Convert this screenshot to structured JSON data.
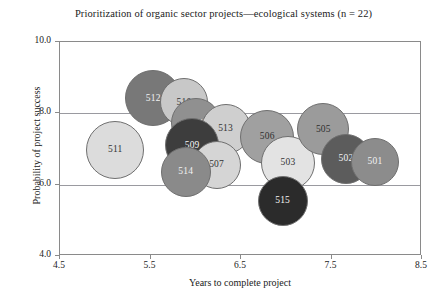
{
  "chart_data": {
    "type": "scatter",
    "title": "Prioritization of organic sector projects—ecological systems (n = 22)",
    "xlabel": "Years to complete project",
    "ylabel": "Probability of project success",
    "xlim": [
      4.5,
      8.5
    ],
    "ylim": [
      4.0,
      10.0
    ],
    "xticks": [
      "4.5",
      "5.5",
      "6.5",
      "7.5",
      "8.5"
    ],
    "yticks": [
      "4.0",
      "6.0",
      "8.0",
      "10.0"
    ],
    "grid": "horizontal",
    "legend": "none",
    "note": "Bubble chart; bubble area encodes project size/budget. Labels are project ID numbers.",
    "points": [
      {
        "label": "511",
        "x": 5.11,
        "y": 6.97,
        "r": 29,
        "color": "#dcdcdc",
        "text_color": "#333333"
      },
      {
        "label": "512",
        "x": 5.53,
        "y": 8.42,
        "r": 28,
        "color": "#787878",
        "text_color": "#f2f2f2"
      },
      {
        "label": "510",
        "x": 5.87,
        "y": 8.31,
        "r": 24,
        "color": "#c8c8c8",
        "text_color": "#333333"
      },
      {
        "label": "504",
        "x": 6.0,
        "y": 7.72,
        "r": 25,
        "color": "#909090",
        "text_color": "#f2f2f2"
      },
      {
        "label": "513",
        "x": 6.33,
        "y": 7.56,
        "r": 25,
        "color": "#cfcfcf",
        "text_color": "#333333"
      },
      {
        "label": "509",
        "x": 5.96,
        "y": 7.1,
        "r": 27,
        "color": "#3d3d3d",
        "text_color": "#f5f5f5"
      },
      {
        "label": "507",
        "x": 6.23,
        "y": 6.55,
        "r": 24,
        "color": "#d5d5d5",
        "text_color": "#333333"
      },
      {
        "label": "514",
        "x": 5.89,
        "y": 6.35,
        "r": 25,
        "color": "#8a8a8a",
        "text_color": "#f2f2f2"
      },
      {
        "label": "506",
        "x": 6.79,
        "y": 7.34,
        "r": 27,
        "color": "#a0a0a0",
        "text_color": "#2e2e2e"
      },
      {
        "label": "503",
        "x": 7.02,
        "y": 6.62,
        "r": 27,
        "color": "#e3e3e3",
        "text_color": "#333333"
      },
      {
        "label": "515",
        "x": 6.96,
        "y": 5.55,
        "r": 25,
        "color": "#2b2b2b",
        "text_color": "#f5f5f5"
      },
      {
        "label": "505",
        "x": 7.41,
        "y": 7.55,
        "r": 26,
        "color": "#9b9b9b",
        "text_color": "#2e2e2e"
      },
      {
        "label": "502",
        "x": 7.66,
        "y": 6.73,
        "r": 25,
        "color": "#5c5c5c",
        "text_color": "#f2f2f2"
      },
      {
        "label": "501",
        "x": 7.98,
        "y": 6.63,
        "r": 24,
        "color": "#8c8c8c",
        "text_color": "#f2f2f2"
      }
    ]
  },
  "axes": {
    "plot_left": 59,
    "plot_top": 41,
    "plot_width": 362,
    "plot_height": 214
  }
}
